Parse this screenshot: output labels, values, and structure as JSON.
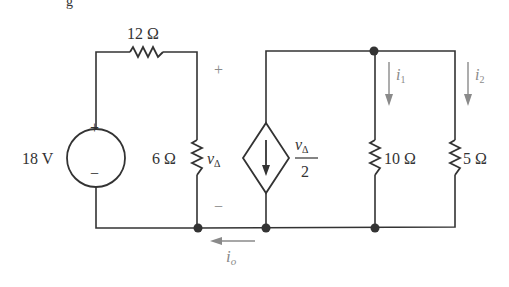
{
  "figure": {
    "title_fragment": "g",
    "colors": {
      "wire": "#333333",
      "annotation": "#8a8a8a",
      "background": "#ffffff"
    }
  },
  "components": {
    "voltage_source": {
      "label": "18 V",
      "plus": "+",
      "minus": "−"
    },
    "r12": {
      "label": "12 Ω"
    },
    "r6": {
      "label": "6 Ω",
      "voltage_label": "v",
      "voltage_sub": "Δ",
      "plus": "+",
      "minus": "−"
    },
    "dependent_source": {
      "numerator": "v",
      "numerator_sub": "Δ",
      "denominator": "2",
      "type": "current-controlled-diamond"
    },
    "r10": {
      "label": "10 Ω",
      "current_label": "i",
      "current_sub": "1"
    },
    "r5": {
      "label": "5 Ω",
      "current_label": "i",
      "current_sub": "2"
    },
    "io": {
      "current_label": "i",
      "current_sub": "o"
    }
  }
}
